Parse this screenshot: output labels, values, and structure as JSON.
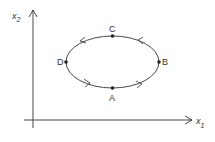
{
  "diagram": {
    "type": "phase-plane limit cycle",
    "axes": {
      "x": {
        "label": "x",
        "subscript": "1"
      },
      "y": {
        "label": "x",
        "subscript": "2"
      }
    },
    "points": [
      {
        "id": "A",
        "label": "A",
        "position": "bottom"
      },
      {
        "id": "B",
        "label": "B",
        "position": "right"
      },
      {
        "id": "C",
        "label": "C",
        "position": "top"
      },
      {
        "id": "D",
        "label": "D",
        "position": "left"
      }
    ],
    "orbit": {
      "direction": "counterclockwise",
      "path": "A → B → C → D → A"
    },
    "colors": {
      "line": "#333333",
      "background": "#ffffff"
    }
  }
}
